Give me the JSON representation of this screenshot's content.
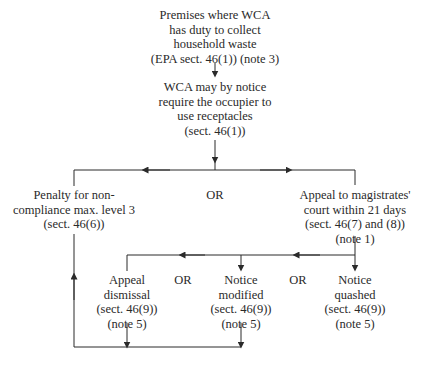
{
  "diagram": {
    "nodes": {
      "premises": {
        "lines": [
          "Premises where WCA",
          "has duty to collect",
          "household waste",
          "(EPA sect. 46(1)) (note 3)"
        ]
      },
      "notice": {
        "lines": [
          "WCA may by notice",
          "require the occupier to",
          "use receptacles",
          "(sect. 46(1))"
        ]
      },
      "penalty": {
        "lines": [
          "Penalty for non-",
          "compliance max. level 3",
          "(sect. 46(6))"
        ]
      },
      "appeal": {
        "lines": [
          "Appeal to magistrates'",
          "court within 21 days",
          "(sect. 46(7) and (8))",
          "(note 1)"
        ]
      },
      "dismissal": {
        "lines": [
          "Appeal",
          "dismissal",
          "(sect. 46(9))",
          "(note 5)"
        ]
      },
      "modified": {
        "lines": [
          "Notice",
          "modified",
          "(sect. 46(9))",
          "(note 5)"
        ]
      },
      "quashed": {
        "lines": [
          "Notice",
          "quashed",
          "(sect. 46(9))",
          "(note 5)"
        ]
      }
    },
    "or_labels": {
      "top": "OR",
      "left": "OR",
      "right": "OR"
    },
    "line_color": "#2a2a2a"
  }
}
